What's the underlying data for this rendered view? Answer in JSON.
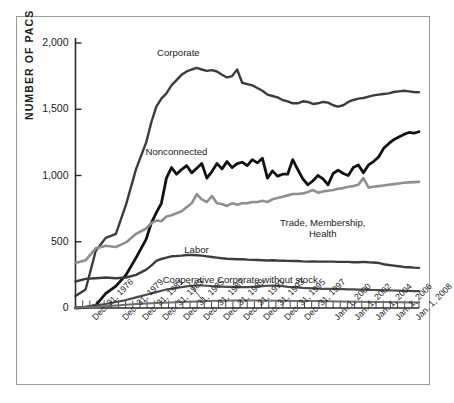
{
  "chart_data": {
    "type": "line",
    "title": "",
    "xlabel": "",
    "ylabel": "NUMBER OF PACS",
    "ylim": [
      0,
      2000
    ],
    "yticks": [
      "0",
      "500",
      "1,000",
      "1,500",
      "2,000"
    ],
    "ytick_values": [
      0,
      500,
      1000,
      1500,
      2000
    ],
    "grid": false,
    "legend_position": "inline-annotations",
    "x_start_year": 1974,
    "x_end_year": 2008,
    "xtick_labels": [
      "Dec. 31, 1976",
      "Dec. 31, 1979",
      "Dec. 31, 1981",
      "Dec. 31, 1983",
      "Dec. 31, 1985",
      "Dec. 31, 1987",
      "Dec. 31, 1989",
      "Dec. 31, 1991",
      "Dec. 31, 1993",
      "Dec. 31, 1995",
      "Dec. 31, 1997",
      "Jan. 1, 2000",
      "Jan. 1, 2002",
      "Jan. 1, 2004",
      "Jan. 1, 2006",
      "Jan. 1, 2008"
    ],
    "xtick_years": [
      1976,
      1979,
      1981,
      1983,
      1985,
      1987,
      1989,
      1991,
      1993,
      1995,
      1997,
      2000,
      2002,
      2004,
      2006,
      2008
    ],
    "series": [
      {
        "name": "Corporate",
        "color": "#3c3c3c",
        "width": 2.4,
        "label_x_year": 1984.2,
        "label_y_value": 1925,
        "x": [
          1974,
          1975,
          1976,
          1977,
          1978,
          1979,
          1980,
          1981,
          1981.5,
          1982,
          1982.5,
          1983,
          1983.5,
          1984,
          1984.5,
          1985,
          1985.5,
          1986,
          1986.5,
          1987,
          1987.5,
          1988,
          1988.5,
          1989,
          1989.5,
          1990,
          1990.5,
          1991,
          1991.5,
          1992,
          1992.5,
          1993,
          1993.5,
          1994,
          1994.5,
          1995,
          1995.5,
          1996,
          1996.5,
          1997,
          1997.5,
          1998,
          1998.5,
          1999,
          1999.5,
          2000,
          2000.5,
          2001,
          2001.5,
          2002,
          2002.5,
          2003,
          2003.5,
          2004,
          2004.5,
          2005,
          2005.5,
          2006,
          2006.5,
          2007,
          2007.5,
          2008
        ],
        "y": [
          90,
          140,
          430,
          530,
          560,
          780,
          1050,
          1250,
          1400,
          1520,
          1580,
          1620,
          1680,
          1720,
          1760,
          1785,
          1800,
          1812,
          1800,
          1790,
          1795,
          1785,
          1760,
          1740,
          1750,
          1800,
          1700,
          1690,
          1680,
          1660,
          1640,
          1610,
          1600,
          1590,
          1570,
          1560,
          1545,
          1545,
          1560,
          1555,
          1540,
          1545,
          1555,
          1550,
          1530,
          1520,
          1530,
          1555,
          1570,
          1580,
          1585,
          1595,
          1605,
          1610,
          1615,
          1620,
          1630,
          1635,
          1640,
          1635,
          1630,
          1628
        ]
      },
      {
        "name": "Nonconnected",
        "color": "#111111",
        "width": 2.8,
        "label_x_year": 1984.0,
        "label_y_value": 1175,
        "x": [
          1974,
          1975,
          1976,
          1977,
          1978,
          1979,
          1980,
          1981,
          1981.5,
          1982,
          1982.5,
          1983,
          1983.5,
          1984,
          1984.5,
          1985,
          1985.5,
          1986,
          1986.5,
          1987,
          1987.5,
          1988,
          1988.5,
          1989,
          1989.5,
          1990,
          1990.5,
          1991,
          1991.5,
          1992,
          1992.5,
          1993,
          1993.5,
          1994,
          1994.5,
          1995,
          1995.5,
          1996,
          1996.5,
          1997,
          1997.5,
          1998,
          1998.5,
          1999,
          1999.5,
          2000,
          2000.5,
          2001,
          2001.5,
          2002,
          2002.5,
          2003,
          2003.5,
          2004,
          2004.5,
          2005,
          2005.5,
          2006,
          2006.5,
          2007,
          2007.5,
          2008
        ],
        "y": [
          0,
          5,
          20,
          110,
          165,
          250,
          380,
          520,
          640,
          720,
          790,
          980,
          1060,
          1010,
          1045,
          1075,
          1020,
          1055,
          1090,
          980,
          1030,
          1090,
          1050,
          1105,
          1060,
          1090,
          1100,
          1075,
          1120,
          1095,
          1130,
          980,
          1035,
          995,
          1010,
          1010,
          1120,
          1045,
          975,
          930,
          960,
          1000,
          975,
          930,
          1015,
          1040,
          1015,
          1000,
          1060,
          1080,
          1020,
          1080,
          1105,
          1140,
          1205,
          1240,
          1270,
          1290,
          1310,
          1325,
          1320,
          1330
        ]
      },
      {
        "name": "Trade, Membership, Health",
        "color": "#8f8f8f",
        "width": 2.6,
        "label_x_year": 1998.5,
        "label_y_value": 640,
        "x": [
          1974,
          1975,
          1976,
          1977,
          1978,
          1979,
          1980,
          1981,
          1981.5,
          1982,
          1982.5,
          1983,
          1983.5,
          1984,
          1984.5,
          1985,
          1985.5,
          1986,
          1986.5,
          1987,
          1987.5,
          1988,
          1988.5,
          1989,
          1989.5,
          1990,
          1990.5,
          1991,
          1991.5,
          1992,
          1992.5,
          1993,
          1993.5,
          1994,
          1994.5,
          1995,
          1995.5,
          1996,
          1996.5,
          1997,
          1997.5,
          1998,
          1998.5,
          1999,
          1999.5,
          2000,
          2000.5,
          2001,
          2001.5,
          2002,
          2002.5,
          2003,
          2003.5,
          2004,
          2004.5,
          2005,
          2005.5,
          2006,
          2006.5,
          2007,
          2007.5,
          2008
        ],
        "y": [
          340,
          360,
          450,
          470,
          460,
          495,
          560,
          600,
          640,
          660,
          655,
          690,
          700,
          715,
          730,
          760,
          790,
          860,
          820,
          800,
          845,
          790,
          785,
          770,
          790,
          780,
          790,
          790,
          800,
          800,
          810,
          800,
          820,
          830,
          840,
          850,
          860,
          860,
          865,
          875,
          890,
          870,
          880,
          885,
          890,
          900,
          905,
          915,
          920,
          930,
          980,
          910,
          915,
          920,
          925,
          930,
          935,
          940,
          945,
          948,
          950,
          952
        ]
      },
      {
        "name": "Labor",
        "color": "#3c3c3c",
        "width": 2.4,
        "label_x_year": 1986.0,
        "label_y_value": 435,
        "x": [
          1974,
          1975,
          1976,
          1977,
          1978,
          1979,
          1980,
          1981,
          1981.5,
          1982,
          1982.5,
          1983,
          1983.5,
          1984,
          1984.5,
          1985,
          1985.5,
          1986,
          1986.5,
          1987,
          1987.5,
          1988,
          1988.5,
          1989,
          1989.5,
          1990,
          1990.5,
          1991,
          1991.5,
          1992,
          1992.5,
          1993,
          1993.5,
          1994,
          1994.5,
          1995,
          1995.5,
          1996,
          1996.5,
          1997,
          1997.5,
          1998,
          1998.5,
          1999,
          1999.5,
          2000,
          2000.5,
          2001,
          2001.5,
          2002,
          2002.5,
          2003,
          2003.5,
          2004,
          2004.5,
          2005,
          2005.5,
          2006,
          2006.5,
          2007,
          2007.5,
          2008
        ],
        "y": [
          200,
          220,
          225,
          230,
          225,
          230,
          250,
          290,
          320,
          355,
          370,
          380,
          390,
          392,
          395,
          400,
          400,
          398,
          395,
          390,
          385,
          380,
          375,
          372,
          370,
          368,
          368,
          365,
          363,
          362,
          360,
          358,
          360,
          358,
          357,
          356,
          355,
          355,
          352,
          350,
          352,
          350,
          350,
          350,
          350,
          348,
          348,
          348,
          345,
          345,
          348,
          345,
          343,
          340,
          330,
          325,
          320,
          315,
          310,
          308,
          305,
          303
        ]
      },
      {
        "name": "Corporate without stock",
        "color": "#4a4a4a",
        "width": 2.2,
        "label_x_year": 1993.0,
        "label_y_value": 212,
        "x": [
          1974,
          1975,
          1976,
          1977,
          1978,
          1979,
          1980,
          1981,
          1981.5,
          1982,
          1982.5,
          1983,
          1983.5,
          1984,
          1984.5,
          1985,
          1985.5,
          1986,
          1986.5,
          1987,
          1987.5,
          1988,
          1988.5,
          1989,
          1989.5,
          1990,
          1990.5,
          1991,
          1991.5,
          1992,
          1992.5,
          1993,
          1993.5,
          1994,
          1994.5,
          1995,
          1995.5,
          1996,
          1996.5,
          1997,
          1997.5,
          1998,
          1998.5,
          1999,
          1999.5,
          2000,
          2000.5,
          2001,
          2001.5,
          2002,
          2002.5,
          2003,
          2003.5,
          2004,
          2004.5,
          2005,
          2005.5,
          2006,
          2006.5,
          2007,
          2007.5,
          2008
        ],
        "y": [
          2,
          8,
          20,
          30,
          45,
          60,
          80,
          100,
          110,
          120,
          130,
          140,
          145,
          152,
          158,
          163,
          168,
          170,
          170,
          168,
          165,
          163,
          162,
          160,
          160,
          158,
          158,
          158,
          160,
          162,
          165,
          168,
          170,
          168,
          165,
          160,
          158,
          155,
          152,
          150,
          148,
          146,
          145,
          145,
          144,
          143,
          142,
          141,
          140,
          139,
          138,
          137,
          136,
          135,
          134,
          133,
          132,
          131,
          130,
          129,
          128,
          128
        ]
      },
      {
        "name": "Cooperative",
        "color": "#6e6e6e",
        "width": 2.0,
        "label_x_year": 1985.2,
        "label_y_value": 212,
        "x": [
          1974,
          1976,
          1978,
          1980,
          1982,
          1984,
          1986,
          1988,
          1990,
          1992,
          1994,
          1996,
          1998,
          2000,
          2002,
          2004,
          2006,
          2008
        ],
        "y": [
          2,
          8,
          18,
          30,
          38,
          44,
          50,
          54,
          56,
          56,
          55,
          53,
          52,
          50,
          48,
          46,
          44,
          42
        ]
      }
    ],
    "annotations": [
      {
        "name": "cooperative-leader-line",
        "from_x_year": 1985.2,
        "from_y_value": 190,
        "to_x_year": 1986.6,
        "to_y_value": 58
      }
    ]
  }
}
